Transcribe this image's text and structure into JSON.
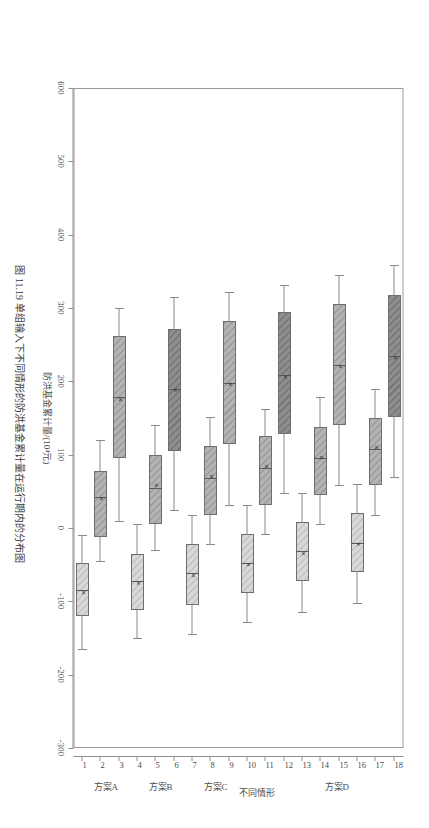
{
  "figure": {
    "caption": "图 11.19   单组输入下不同情形的防洪基金累计量在运行期内的分布图",
    "frame_color": "#9a9a9a"
  },
  "chart_data": {
    "type": "box",
    "title": "",
    "orientation": "vertical-boxes-rotated",
    "xlabel": "不同情形",
    "ylabel": "防洪基金累计量/(10⁴元)",
    "ylim": [
      -300,
      600
    ],
    "yticks": [
      600,
      500,
      400,
      300,
      200,
      100,
      0,
      -100,
      -200,
      -300
    ],
    "ytick_labels": [
      "600",
      "500",
      "400",
      "300",
      "200",
      "100",
      "0",
      "-100",
      "-200",
      "-300"
    ],
    "grid": false,
    "legend": null,
    "categories": [
      "1",
      "2",
      "3",
      "4",
      "5",
      "6",
      "7",
      "8",
      "9",
      "10",
      "11",
      "12",
      "13",
      "14",
      "15",
      "16",
      "17",
      "18"
    ],
    "groups": [
      {
        "label": "方案A",
        "ticks": [
          1,
          2,
          3
        ]
      },
      {
        "label": "方案B",
        "ticks": [
          4,
          5,
          6
        ]
      },
      {
        "label": "方案C",
        "ticks": [
          7,
          8,
          9
        ]
      },
      {
        "label": "方案D",
        "ticks": [
          13,
          14,
          15
        ]
      }
    ],
    "group_label_positions": [
      {
        "label": "方案A",
        "at": 1.6
      },
      {
        "label": "方案B",
        "at": 4.6
      },
      {
        "label": "方案C",
        "at": 7.6
      },
      {
        "label": "方案D",
        "at": 14.2
      }
    ],
    "fill_styles": {
      "dark": "#8e8e8e",
      "mid": "#b3b3b3",
      "light": "#d8d8d8"
    },
    "boxes": [
      {
        "category": "1",
        "style": "light",
        "min": -165,
        "q1": -120,
        "median": -85,
        "mean": -88,
        "q3": -48,
        "max": -10
      },
      {
        "category": "2",
        "style": "mid",
        "min": -45,
        "q1": -12,
        "median": 42,
        "mean": 40,
        "q3": 78,
        "max": 120
      },
      {
        "category": "3",
        "style": "mid",
        "min": 10,
        "q1": 95,
        "median": 178,
        "mean": 175,
        "q3": 262,
        "max": 300
      },
      {
        "category": "4",
        "style": "light",
        "min": -150,
        "q1": -112,
        "median": -72,
        "mean": -75,
        "q3": -35,
        "max": 5
      },
      {
        "category": "5",
        "style": "mid",
        "min": -30,
        "q1": 5,
        "median": 55,
        "mean": 58,
        "q3": 100,
        "max": 140
      },
      {
        "category": "6",
        "style": "dark",
        "min": 25,
        "q1": 105,
        "median": 190,
        "mean": 188,
        "q3": 272,
        "max": 315
      },
      {
        "category": "7",
        "style": "light",
        "min": -145,
        "q1": -105,
        "median": -62,
        "mean": -65,
        "q3": -22,
        "max": 18
      },
      {
        "category": "8",
        "style": "mid",
        "min": -22,
        "q1": 18,
        "median": 68,
        "mean": 70,
        "q3": 112,
        "max": 152
      },
      {
        "category": "9",
        "style": "mid",
        "min": 32,
        "q1": 115,
        "median": 198,
        "mean": 196,
        "q3": 282,
        "max": 322
      },
      {
        "category": "10",
        "style": "light",
        "min": -128,
        "q1": -88,
        "median": -48,
        "mean": -50,
        "q3": -8,
        "max": 32
      },
      {
        "category": "11",
        "style": "mid",
        "min": -8,
        "q1": 32,
        "median": 82,
        "mean": 84,
        "q3": 125,
        "max": 162
      },
      {
        "category": "12",
        "style": "dark",
        "min": 48,
        "q1": 128,
        "median": 208,
        "mean": 206,
        "q3": 295,
        "max": 332
      },
      {
        "category": "13",
        "style": "light",
        "min": -115,
        "q1": -72,
        "median": -32,
        "mean": -35,
        "q3": 8,
        "max": 48
      },
      {
        "category": "14",
        "style": "mid",
        "min": 5,
        "q1": 45,
        "median": 95,
        "mean": 96,
        "q3": 138,
        "max": 178
      },
      {
        "category": "15",
        "style": "mid",
        "min": 58,
        "q1": 140,
        "median": 222,
        "mean": 220,
        "q3": 305,
        "max": 345
      },
      {
        "category": "16",
        "style": "light",
        "min": -102,
        "q1": -60,
        "median": -20,
        "mean": -22,
        "q3": 20,
        "max": 60
      },
      {
        "category": "17",
        "style": "mid",
        "min": 18,
        "q1": 58,
        "median": 108,
        "mean": 110,
        "q3": 150,
        "max": 190
      },
      {
        "category": "18",
        "style": "dark",
        "min": 70,
        "q1": 152,
        "median": 235,
        "mean": 232,
        "q3": 318,
        "max": 358
      }
    ],
    "mean_marker": "×"
  }
}
